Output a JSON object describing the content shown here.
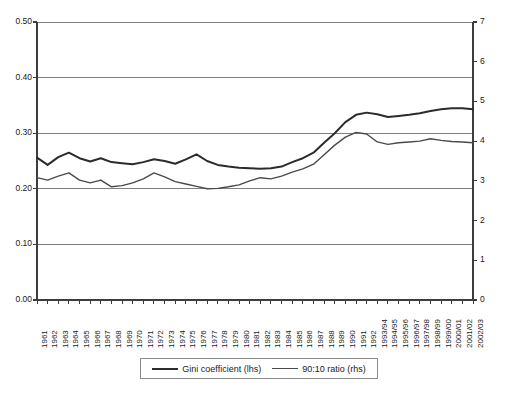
{
  "chart_data": {
    "type": "line",
    "title": "",
    "subtitle": "",
    "xlabel": "",
    "ylabel": "",
    "grid": true,
    "legend_position": "bottom",
    "axes": {
      "left": {
        "label": "",
        "ylim": [
          0.0,
          0.5
        ],
        "ticks": [
          0.0,
          0.1,
          0.2,
          0.3,
          0.4,
          0.5
        ],
        "tick_labels": [
          "0.00",
          "0.10",
          "0.20",
          "0.30",
          "0.40",
          "0.50"
        ]
      },
      "right": {
        "label": "",
        "ylim": [
          0,
          7
        ],
        "ticks": [
          0,
          1,
          2,
          3,
          4,
          5,
          6,
          7
        ],
        "tick_labels": [
          "0",
          "1",
          "2",
          "3",
          "4",
          "5",
          "6",
          "7"
        ]
      }
    },
    "categories": [
      "1961",
      "1962",
      "1963",
      "1964",
      "1965",
      "1966",
      "1967",
      "1968",
      "1969",
      "1970",
      "1971",
      "1972",
      "1973",
      "1974",
      "1975",
      "1976",
      "1977",
      "1978",
      "1979",
      "1980",
      "1981",
      "1982",
      "1983",
      "1984",
      "1985",
      "1986",
      "1987",
      "1988",
      "1989",
      "1990",
      "1991",
      "1992",
      "1993/94",
      "1994/95",
      "1995/96",
      "1996/97",
      "1997/98",
      "1998/99",
      "1999/00",
      "2000/01",
      "2001/02",
      "2002/03"
    ],
    "series": [
      {
        "name": "Gini coefficient (lhs)",
        "axis": "left",
        "color": "#2b2b2b",
        "width": 2,
        "values": [
          0.256,
          0.243,
          0.257,
          0.265,
          0.255,
          0.249,
          0.255,
          0.248,
          0.246,
          0.244,
          0.248,
          0.253,
          0.25,
          0.245,
          0.253,
          0.262,
          0.25,
          0.243,
          0.24,
          0.238,
          0.237,
          0.236,
          0.237,
          0.24,
          0.248,
          0.255,
          0.265,
          0.283,
          0.3,
          0.32,
          0.333,
          0.337,
          0.334,
          0.329,
          0.331,
          0.333,
          0.336,
          0.34,
          0.343,
          0.345,
          0.345,
          0.343
        ]
      },
      {
        "name": "90:10 ratio (rhs)",
        "axis": "right",
        "color": "#4a4a4a",
        "width": 1.4,
        "values": [
          3.08,
          3.02,
          3.12,
          3.2,
          3.02,
          2.95,
          3.02,
          2.85,
          2.88,
          2.95,
          3.05,
          3.2,
          3.1,
          2.98,
          2.92,
          2.86,
          2.8,
          2.81,
          2.85,
          2.9,
          3.0,
          3.08,
          3.05,
          3.12,
          3.22,
          3.3,
          3.42,
          3.66,
          3.9,
          4.1,
          4.22,
          4.18,
          3.98,
          3.92,
          3.96,
          3.98,
          4.0,
          4.06,
          4.02,
          3.99,
          3.98,
          3.96
        ]
      }
    ],
    "legend": [
      {
        "label": "Gini coefficient (lhs)",
        "swatch": "thick"
      },
      {
        "label": "90:10 ratio (rhs)",
        "swatch": "thin"
      }
    ]
  },
  "colors": {
    "gini_line": "#2b2b2b",
    "ratio_line": "#4a4a4a",
    "gridline": "#808080",
    "axis": "#4d4d4d",
    "background": "#ffffff"
  }
}
